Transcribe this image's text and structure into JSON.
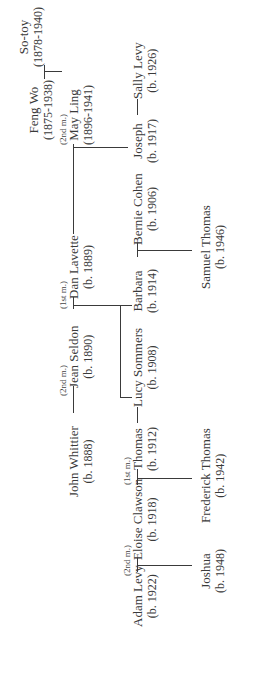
{
  "tree": {
    "people": {
      "feng_wo": {
        "name": "Feng Wo",
        "dates": "(1875-1938)"
      },
      "so_toy": {
        "name": "So-toy",
        "dates": "(1878-1940)"
      },
      "may_ling": {
        "name": "May Ling",
        "dates": "(1896-1941)"
      },
      "dan_lavette": {
        "name": "Dan Lavette",
        "dates": "(b. 1889)"
      },
      "joseph": {
        "name": "Joseph",
        "dates": "(b. 1917)"
      },
      "sally_levy": {
        "name": "Sally Levy",
        "dates": "(b. 1926)"
      },
      "john_whittier": {
        "name": "John Whittier",
        "dates": "(b. 1888)"
      },
      "jean_seldon": {
        "name": "Jean Seldon",
        "dates": "(b. 1890)"
      },
      "barbara": {
        "name": "Barbara",
        "dates": "(b. 1914)"
      },
      "bernie_cohen": {
        "name": "Bernie Cohen",
        "dates": "(b. 1906)"
      },
      "samuel_thomas": {
        "name": "Samuel Thomas",
        "dates": "(b. 1946)"
      },
      "thomas": {
        "name": "Thomas",
        "dates": "(b. 1912)"
      },
      "lucy_sommers": {
        "name": "Lucy Sommers",
        "dates": "(b. 1908)"
      },
      "eloise_clawson": {
        "name": "Eloise Clawson",
        "dates": "(b. 1918)"
      },
      "frederick_thomas": {
        "name": "Frederick Thomas",
        "dates": "(b. 1942)"
      },
      "adam_levy": {
        "name": "Adam Levy",
        "dates": "(b. 1922)"
      },
      "joshua": {
        "name": "Joshua",
        "dates": "(b. 1948)"
      }
    },
    "marriage_labels": {
      "dan_may": "(2nd m.)",
      "dan_jean": "(1st m.)",
      "john_jean": "(2nd m.)",
      "eloise_thomas": "(1st m.)",
      "adam_eloise": "(2nd m.)"
    },
    "connector": "—"
  }
}
